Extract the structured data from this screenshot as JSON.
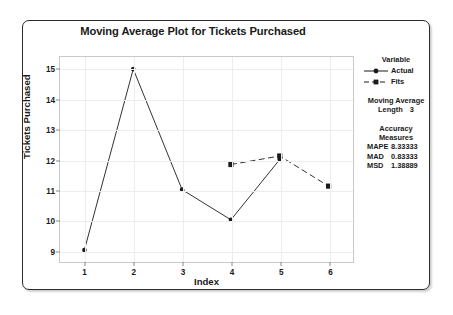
{
  "chart_data": {
    "type": "line",
    "title": "Moving Average Plot for Tickets Purchased",
    "xlabel": "Index",
    "ylabel": "Tickets Purchased",
    "x": [
      1,
      2,
      3,
      4,
      5,
      6
    ],
    "xlim": [
      0.5,
      6.5
    ],
    "ylim": [
      8.6,
      15.4
    ],
    "xticks": [
      "1",
      "2",
      "3",
      "4",
      "5",
      "6"
    ],
    "yticks": [
      "9",
      "10",
      "11",
      "12",
      "13",
      "14",
      "15"
    ],
    "grid": true,
    "legend_position": "right",
    "series": [
      {
        "name": "Actual",
        "marker": "circle",
        "linestyle": "solid",
        "color": "#1a1a1a",
        "x": [
          1,
          2,
          3,
          4,
          5
        ],
        "values": [
          9,
          15,
          11,
          10,
          12
        ]
      },
      {
        "name": "Fits",
        "marker": "square",
        "linestyle": "dashed",
        "color": "#1a1a1a",
        "x": [
          4,
          5,
          6
        ],
        "values": [
          11.83333,
          12.11667,
          11.11667
        ]
      }
    ]
  },
  "legend": {
    "title": "Variable",
    "entries": [
      {
        "label": "Actual",
        "marker": "circle-marker",
        "linestyle": "solid"
      },
      {
        "label": "Fits",
        "marker": "square-marker",
        "linestyle": "dashed"
      }
    ]
  },
  "moving_average": {
    "heading_line1": "Moving Average",
    "length_label": "Length",
    "length_value": "3"
  },
  "accuracy": {
    "heading": "Accuracy Measures",
    "rows": [
      {
        "name": "MAPE",
        "value": "8.33333"
      },
      {
        "name": "MAD",
        "value": "0.83333"
      },
      {
        "name": "MSD",
        "value": "1.38889"
      }
    ]
  },
  "colors": {
    "frame_border": "#2b2b2b",
    "plot_border": "#c9c9c9",
    "gridline": "#ededed",
    "data": "#1a1a1a",
    "background": "#ffffff"
  }
}
